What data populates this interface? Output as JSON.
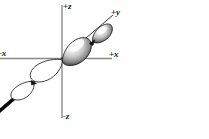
{
  "figure": {
    "background_color": "#ffffff"
  },
  "axes": {
    "color": "#808080",
    "labels": {
      "plus_z": "+z",
      "minus_z": "-z",
      "plus_x": "+x",
      "minus_x": "-x",
      "plus_y": "+y"
    }
  },
  "orbital": {
    "name": "two-lobe-pair-orbital",
    "filled_lobes": {
      "count": 2,
      "direction": "+y",
      "fill_description": "shaded three-dimensional lobes",
      "highlight_color": "#ffffff",
      "shadow_color": "#1c1c1c",
      "outline_color": "#000000"
    },
    "outline_lobes": {
      "count": 2,
      "direction": "-y",
      "fill_description": "hollow outlined lobes",
      "fill_color": "#ffffff",
      "outline_color": "#1a1a1a"
    },
    "y_axis_line_color": "#111111"
  }
}
